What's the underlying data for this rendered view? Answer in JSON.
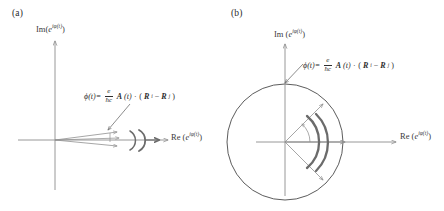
{
  "figure": {
    "panels": [
      {
        "id": "a",
        "label": "(a)",
        "axes": {
          "imaginary_label_prefix": "Im(",
          "imaginary_label_base": "e",
          "imaginary_label_exponent": "iφ(t)",
          "imaginary_label_suffix": ")",
          "real_label_prefix": "Re (",
          "real_label_base": "e",
          "real_label_exponent": "iφ(t)",
          "real_label_suffix": ")"
        },
        "annotation": {
          "lhs": "ϕ(t)=",
          "numerator": "e",
          "denominator": "ħc",
          "vector_a": "A",
          "vector_a_arg": "(t)",
          "dot": "·",
          "open_paren": "(",
          "vector_r1": "R",
          "vector_r1_sub": "i",
          "minus": "−",
          "vector_r2": "R",
          "vector_r2_sub": "j",
          "close_paren": ")"
        },
        "description": "Small phase spread: narrow fan of vectors near the positive real axis with two curved sweep arrows."
      },
      {
        "id": "b",
        "label": "(b)",
        "axes": {
          "imaginary_label_prefix": "Im (",
          "imaginary_label_base": "e",
          "imaginary_label_exponent": "iφ(t)",
          "imaginary_label_suffix": ")",
          "real_label_prefix": "Re (",
          "real_label_base": "e",
          "real_label_exponent": "iφ(t)",
          "real_label_suffix": ")"
        },
        "annotation": {
          "lhs": "ϕ(t)=",
          "numerator": "e",
          "denominator": "ħc",
          "vector_a": "A",
          "vector_a_arg": "(t)",
          "dot": "·",
          "open_paren": "(",
          "vector_r1": "R",
          "vector_r1_sub": "i",
          "minus": "−",
          "vector_r2": "R",
          "vector_r2_sub": "j",
          "close_paren": ")"
        },
        "description": "Large phase spread: unit circle with vectors fanning from +45 degrees to -45 degrees and two bold curved sweep arrows."
      }
    ],
    "colors": {
      "axis": "#8c8c8c",
      "vector": "#8f8f8f",
      "sweep_arc": "#6b6b6b",
      "circle": "#4a4a4a",
      "text": "#2a2a2a",
      "leader_line": "#6f6f6f",
      "background": "#ffffff"
    }
  }
}
